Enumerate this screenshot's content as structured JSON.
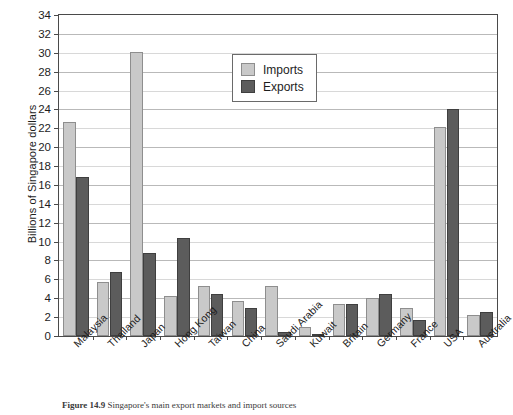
{
  "chart_data": {
    "type": "bar",
    "title": "",
    "xlabel": "",
    "ylabel": "Billions of Singapore dollars",
    "ylim": [
      0,
      34
    ],
    "ytick_step": 2,
    "grid": true,
    "legend_position": "inside-top-center",
    "categories": [
      "Malaysia",
      "Thailand",
      "Japan",
      "Hong Kong",
      "Taiwan",
      "China",
      "Saudi Arabia",
      "Kuwait",
      "Britain",
      "Germany",
      "France",
      "USA",
      "Australia"
    ],
    "yticks": [
      0,
      2,
      4,
      6,
      8,
      10,
      12,
      14,
      16,
      18,
      20,
      22,
      24,
      26,
      28,
      30,
      32,
      34
    ],
    "series": [
      {
        "name": "Imports",
        "color": "#c9c9c9",
        "values": [
          22.7,
          5.7,
          30.1,
          4.2,
          5.3,
          3.7,
          5.3,
          1.0,
          3.4,
          4.0,
          3.0,
          22.1,
          2.2
        ]
      },
      {
        "name": "Exports",
        "color": "#5c5c5c",
        "values": [
          16.8,
          6.8,
          8.8,
          10.4,
          4.5,
          3.0,
          0.4,
          0.1,
          3.4,
          4.5,
          1.7,
          24.0,
          2.5
        ]
      }
    ]
  },
  "legend": {
    "items": [
      {
        "label": "Imports",
        "swatch": "imports"
      },
      {
        "label": "Exports",
        "swatch": "exports"
      }
    ]
  },
  "caption": {
    "figure_number": "Figure 14.9",
    "text": "Singapore's main export markets and import sources"
  }
}
